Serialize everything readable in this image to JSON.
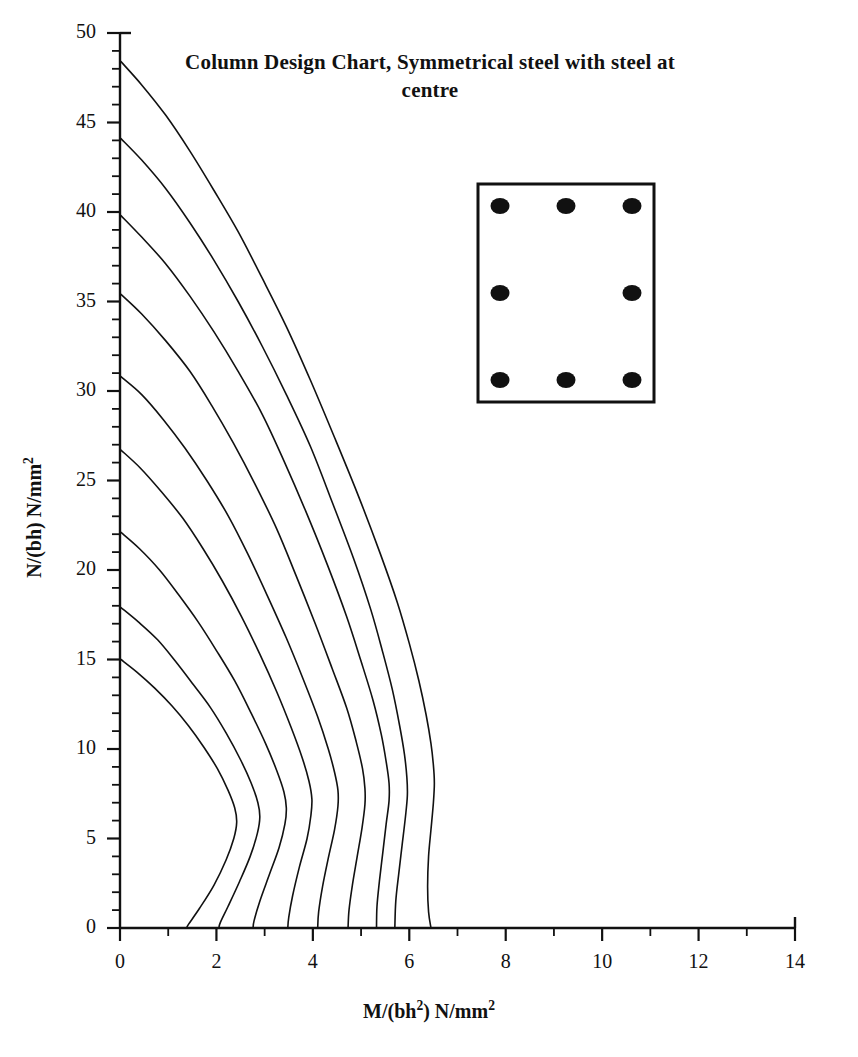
{
  "chart_data": {
    "type": "line",
    "title": "Column Design Chart, Symmetrical steel with steel at centre",
    "xlabel": "M/(bh²) N/mm²",
    "ylabel": "N/(bh) N/mm²",
    "xlabel_parts": {
      "pre": "M/(bh",
      "sup1": "2",
      "mid": ") N/mm",
      "sup2": "2"
    },
    "ylabel_parts": {
      "pre": "N/(bh) N/mm",
      "sup1": "2"
    },
    "xlim": [
      0,
      14
    ],
    "ylim": [
      0,
      50
    ],
    "x_major_ticks": [
      0,
      2,
      4,
      6,
      8,
      10,
      12,
      14
    ],
    "x_tick_labels": [
      "0",
      "2",
      "4",
      "6",
      "8",
      "10",
      "12",
      "14"
    ],
    "x_minor_step": 1,
    "y_major_ticks": [
      0,
      5,
      10,
      15,
      20,
      25,
      30,
      35,
      40,
      45,
      50
    ],
    "y_tick_labels": [
      "0",
      "5",
      "10",
      "15",
      "20",
      "25",
      "30",
      "35",
      "40",
      "45",
      "50"
    ],
    "y_minor_step": 1,
    "grid": false,
    "legend": "none",
    "line_color": "#111111",
    "line_width": 1.6,
    "series": [
      {
        "name": "curve-1",
        "points": [
          [
            0.02,
            48.4
          ],
          [
            0.45,
            47.1
          ],
          [
            0.95,
            45.4
          ],
          [
            1.45,
            43.4
          ],
          [
            1.95,
            41.2
          ],
          [
            2.45,
            38.9
          ],
          [
            2.95,
            36.3
          ],
          [
            3.45,
            33.6
          ],
          [
            3.95,
            30.6
          ],
          [
            4.45,
            27.4
          ],
          [
            4.95,
            24.1
          ],
          [
            5.4,
            20.9
          ],
          [
            5.75,
            18.2
          ],
          [
            6.0,
            15.9
          ],
          [
            6.2,
            13.8
          ],
          [
            6.35,
            11.9
          ],
          [
            6.45,
            10.3
          ],
          [
            6.5,
            9.1
          ],
          [
            6.52,
            8.1
          ],
          [
            6.5,
            7.0
          ],
          [
            6.45,
            5.5
          ],
          [
            6.4,
            4.0
          ],
          [
            6.38,
            2.3
          ],
          [
            6.4,
            0.9
          ],
          [
            6.45,
            0.0
          ]
        ]
      },
      {
        "name": "curve-2",
        "points": [
          [
            0.02,
            44.1
          ],
          [
            0.45,
            42.9
          ],
          [
            0.95,
            41.3
          ],
          [
            1.45,
            39.4
          ],
          [
            1.95,
            37.3
          ],
          [
            2.45,
            35.0
          ],
          [
            2.95,
            32.5
          ],
          [
            3.45,
            29.8
          ],
          [
            3.95,
            26.9
          ],
          [
            4.4,
            23.8
          ],
          [
            4.85,
            20.6
          ],
          [
            5.2,
            17.8
          ],
          [
            5.45,
            15.4
          ],
          [
            5.65,
            13.3
          ],
          [
            5.8,
            11.3
          ],
          [
            5.9,
            9.7
          ],
          [
            5.95,
            8.4
          ],
          [
            5.96,
            7.4
          ],
          [
            5.92,
            6.2
          ],
          [
            5.85,
            4.6
          ],
          [
            5.78,
            3.0
          ],
          [
            5.72,
            1.5
          ],
          [
            5.7,
            0.0
          ]
        ]
      },
      {
        "name": "curve-3",
        "points": [
          [
            0.02,
            39.8
          ],
          [
            0.45,
            38.6
          ],
          [
            0.95,
            37.1
          ],
          [
            1.45,
            35.3
          ],
          [
            1.95,
            33.3
          ],
          [
            2.45,
            31.1
          ],
          [
            2.95,
            28.7
          ],
          [
            3.4,
            26.1
          ],
          [
            3.85,
            23.3
          ],
          [
            4.3,
            20.3
          ],
          [
            4.7,
            17.4
          ],
          [
            5.0,
            14.9
          ],
          [
            5.25,
            12.7
          ],
          [
            5.42,
            10.8
          ],
          [
            5.52,
            9.3
          ],
          [
            5.58,
            8.1
          ],
          [
            5.58,
            7.1
          ],
          [
            5.52,
            5.8
          ],
          [
            5.45,
            4.2
          ],
          [
            5.38,
            2.6
          ],
          [
            5.33,
            1.2
          ],
          [
            5.32,
            0.0
          ]
        ]
      },
      {
        "name": "curve-4",
        "points": [
          [
            0.02,
            35.4
          ],
          [
            0.45,
            34.3
          ],
          [
            0.95,
            32.8
          ],
          [
            1.45,
            31.1
          ],
          [
            1.9,
            29.2
          ],
          [
            2.35,
            27.1
          ],
          [
            2.8,
            24.8
          ],
          [
            3.25,
            22.3
          ],
          [
            3.65,
            19.7
          ],
          [
            4.05,
            17.0
          ],
          [
            4.4,
            14.5
          ],
          [
            4.7,
            12.3
          ],
          [
            4.9,
            10.4
          ],
          [
            5.03,
            8.9
          ],
          [
            5.08,
            7.8
          ],
          [
            5.08,
            6.9
          ],
          [
            5.02,
            5.6
          ],
          [
            4.92,
            4.0
          ],
          [
            4.82,
            2.4
          ],
          [
            4.75,
            1.0
          ],
          [
            4.73,
            0.0
          ]
        ]
      },
      {
        "name": "curve-5",
        "points": [
          [
            0.02,
            30.8
          ],
          [
            0.45,
            29.8
          ],
          [
            0.9,
            28.4
          ],
          [
            1.35,
            26.8
          ],
          [
            1.8,
            25.0
          ],
          [
            2.25,
            23.0
          ],
          [
            2.65,
            20.9
          ],
          [
            3.05,
            18.6
          ],
          [
            3.45,
            16.2
          ],
          [
            3.8,
            13.9
          ],
          [
            4.1,
            11.8
          ],
          [
            4.32,
            10.0
          ],
          [
            4.45,
            8.7
          ],
          [
            4.52,
            7.7
          ],
          [
            4.52,
            6.8
          ],
          [
            4.45,
            5.5
          ],
          [
            4.32,
            3.9
          ],
          [
            4.2,
            2.3
          ],
          [
            4.12,
            0.9
          ],
          [
            4.1,
            0.0
          ]
        ]
      },
      {
        "name": "curve-6",
        "points": [
          [
            0.02,
            26.7
          ],
          [
            0.42,
            25.7
          ],
          [
            0.85,
            24.4
          ],
          [
            1.3,
            22.9
          ],
          [
            1.72,
            21.2
          ],
          [
            2.12,
            19.4
          ],
          [
            2.52,
            17.4
          ],
          [
            2.9,
            15.3
          ],
          [
            3.25,
            13.2
          ],
          [
            3.55,
            11.2
          ],
          [
            3.78,
            9.5
          ],
          [
            3.92,
            8.2
          ],
          [
            3.98,
            7.2
          ],
          [
            3.96,
            6.3
          ],
          [
            3.88,
            5.0
          ],
          [
            3.72,
            3.4
          ],
          [
            3.58,
            1.8
          ],
          [
            3.5,
            0.6
          ],
          [
            3.48,
            0.0
          ]
        ]
      },
      {
        "name": "curve-7",
        "points": [
          [
            0.02,
            22.1
          ],
          [
            0.4,
            21.2
          ],
          [
            0.82,
            20.0
          ],
          [
            1.22,
            18.6
          ],
          [
            1.62,
            17.1
          ],
          [
            2.0,
            15.5
          ],
          [
            2.38,
            13.8
          ],
          [
            2.72,
            12.0
          ],
          [
            3.02,
            10.3
          ],
          [
            3.25,
            8.8
          ],
          [
            3.4,
            7.6
          ],
          [
            3.45,
            6.7
          ],
          [
            3.42,
            5.8
          ],
          [
            3.3,
            4.5
          ],
          [
            3.1,
            3.0
          ],
          [
            2.9,
            1.5
          ],
          [
            2.78,
            0.4
          ],
          [
            2.76,
            0.0
          ]
        ]
      },
      {
        "name": "curve-8",
        "points": [
          [
            0.02,
            17.9
          ],
          [
            0.38,
            17.1
          ],
          [
            0.78,
            16.1
          ],
          [
            1.15,
            14.9
          ],
          [
            1.52,
            13.6
          ],
          [
            1.88,
            12.3
          ],
          [
            2.2,
            10.9
          ],
          [
            2.5,
            9.4
          ],
          [
            2.72,
            8.1
          ],
          [
            2.86,
            7.0
          ],
          [
            2.9,
            6.2
          ],
          [
            2.85,
            5.3
          ],
          [
            2.7,
            4.0
          ],
          [
            2.48,
            2.6
          ],
          [
            2.24,
            1.2
          ],
          [
            2.08,
            0.3
          ],
          [
            2.05,
            0.0
          ]
        ]
      },
      {
        "name": "curve-9",
        "points": [
          [
            0.02,
            15.0
          ],
          [
            0.35,
            14.3
          ],
          [
            0.72,
            13.4
          ],
          [
            1.08,
            12.4
          ],
          [
            1.42,
            11.3
          ],
          [
            1.74,
            10.1
          ],
          [
            2.02,
            8.9
          ],
          [
            2.24,
            7.7
          ],
          [
            2.38,
            6.7
          ],
          [
            2.42,
            5.9
          ],
          [
            2.36,
            5.0
          ],
          [
            2.2,
            3.8
          ],
          [
            1.95,
            2.4
          ],
          [
            1.65,
            1.1
          ],
          [
            1.42,
            0.2
          ],
          [
            1.38,
            0.0
          ]
        ]
      }
    ]
  },
  "section_diagram": {
    "name": "column-cross-section",
    "outline_color": "#111111",
    "bar_color": "#111111",
    "bars": [
      {
        "label": "top-left"
      },
      {
        "label": "top-centre"
      },
      {
        "label": "top-right"
      },
      {
        "label": "mid-left"
      },
      {
        "label": "mid-right"
      },
      {
        "label": "bottom-left"
      },
      {
        "label": "bottom-centre"
      },
      {
        "label": "bottom-right"
      }
    ]
  }
}
